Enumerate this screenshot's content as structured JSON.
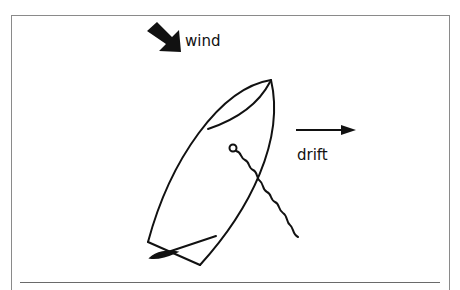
{
  "diagram": {
    "labels": {
      "wind": "wind",
      "drift": "drift"
    },
    "elements": {
      "wind_arrow": {
        "icon": "wind-arrow-icon",
        "direction": "down-right",
        "style": "thick-filled"
      },
      "drift_arrow": {
        "icon": "drift-arrow-icon",
        "direction": "right",
        "style": "thin-line-with-head"
      },
      "boat": {
        "shape": "dinghy-hull-top-view",
        "orientation": "bow up-right, stern down-left"
      },
      "rudder_tiller": {
        "shape": "tiller-with-blade"
      },
      "line": {
        "shape": "wavy-line-with-ring",
        "description": "drogue/anchor line trailing from boat"
      }
    },
    "colors": {
      "stroke": "#111111",
      "frame": "#8a8a8a",
      "background": "#ffffff"
    }
  }
}
